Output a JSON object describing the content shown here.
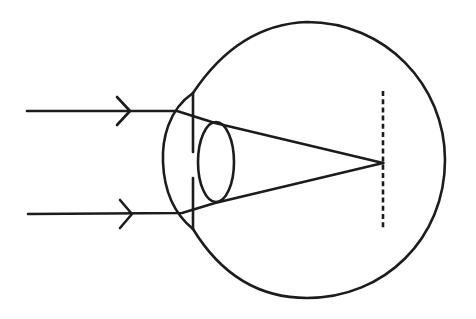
{
  "diagram": {
    "title": "Eye ray diagram: parallel rays focused in front of the retina",
    "type": "optics-eye-diagram",
    "background_color": "#ffffff",
    "stroke_color": "#1c1c1c",
    "elements": {
      "eyeball": {
        "shape": "circle",
        "center": [
          307,
          160
        ],
        "radius": 138
      },
      "cornea": {
        "shape": "arc",
        "top": [
          193,
          93
        ],
        "bottom": [
          193,
          229
        ],
        "leftmost": [
          163,
          160
        ]
      },
      "iris_upper": {
        "x": 193,
        "y_from": 93,
        "y_to": 152
      },
      "iris_lower": {
        "x": 193,
        "y_from": 178,
        "y_to": 229
      },
      "lens": {
        "shape": "ellipse",
        "center": [
          216,
          162
        ],
        "rx": 18,
        "ry": 40
      },
      "retina": {
        "style": "dashed",
        "x": 383,
        "y_from": 91,
        "y_to": 229
      },
      "focal_point": [
        383,
        163
      ],
      "rays": [
        {
          "name": "upper-ray",
          "start": [
            27,
            111
          ],
          "arrow_tip": [
            130,
            111
          ],
          "cornea_hit": [
            177,
            111
          ],
          "lens_hit": [
            215,
            123
          ],
          "end": [
            383,
            163
          ]
        },
        {
          "name": "lower-ray",
          "start": [
            28,
            214
          ],
          "arrow_tip": [
            132,
            214
          ],
          "cornea_hit": [
            182,
            213
          ],
          "lens_hit": [
            215,
            203
          ],
          "end": [
            383,
            163
          ]
        }
      ]
    },
    "labels": []
  }
}
